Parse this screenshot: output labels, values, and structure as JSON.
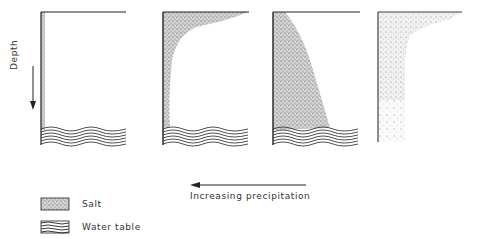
{
  "diagram": {
    "axis_label": "Depth",
    "arrow_label": "Increasing precipitation",
    "arrow_direction": "left",
    "panels": [
      {
        "id": 1,
        "salt_profile": "thin band along left edge only"
      },
      {
        "id": 2,
        "salt_profile": "concentrated near surface and upper left, curving down left side"
      },
      {
        "id": 3,
        "salt_profile": "wedge filling most of column down to water table"
      },
      {
        "id": 4,
        "salt_profile": "diffuse salt near surface and in left column, no water table shown"
      }
    ],
    "legend": [
      {
        "label": "Salt",
        "pattern": "stipple"
      },
      {
        "label": "Water table",
        "pattern": "wavy-lines"
      }
    ]
  },
  "colors": {
    "ink": "#222222",
    "background": "#ffffff"
  }
}
